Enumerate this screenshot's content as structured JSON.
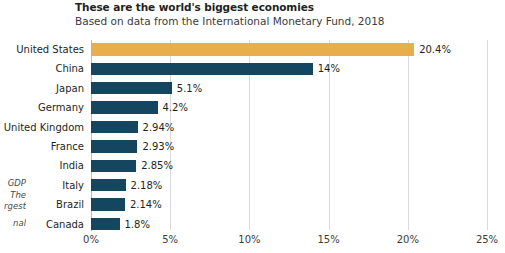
{
  "header": {
    "title": "These are the world's biggest economies",
    "subtitle": "Based on data from the International Monetary Fund, 2018"
  },
  "side_note": {
    "line1": "GDP",
    "line2": "The",
    "line3": "rgest",
    "line4": "nal"
  },
  "colors": {
    "highlight": "#e8ae4b",
    "bar": "#14465f",
    "gridline": "#d7d9db",
    "axis": "#b9bcbe",
    "text": "#231f20",
    "background": "#ffffff"
  },
  "chart_data": {
    "type": "bar",
    "orientation": "horizontal",
    "title": "These are the world's biggest economies",
    "subtitle": "Based on data from the International Monetary Fund, 2018",
    "xlabel": "",
    "ylabel": "",
    "xlim": [
      0,
      25
    ],
    "grid": true,
    "legend": "none",
    "xticks": [
      "0%",
      "5%",
      "10%",
      "15%",
      "20%",
      "25%"
    ],
    "xtick_values": [
      0,
      5,
      10,
      15,
      20,
      25
    ],
    "categories": [
      "United States",
      "China",
      "Japan",
      "Germany",
      "United Kingdom",
      "France",
      "India",
      "Italy",
      "Brazil",
      "Canada"
    ],
    "values": [
      20.4,
      14,
      5.1,
      4.2,
      2.94,
      2.93,
      2.85,
      2.18,
      2.14,
      1.8
    ],
    "labels": [
      "20.4%",
      "14%",
      "5.1%",
      "4.2%",
      "2.94%",
      "2.93%",
      "2.85%",
      "2.18%",
      "2.14%",
      "1.8%"
    ],
    "highlight_index": 0
  }
}
